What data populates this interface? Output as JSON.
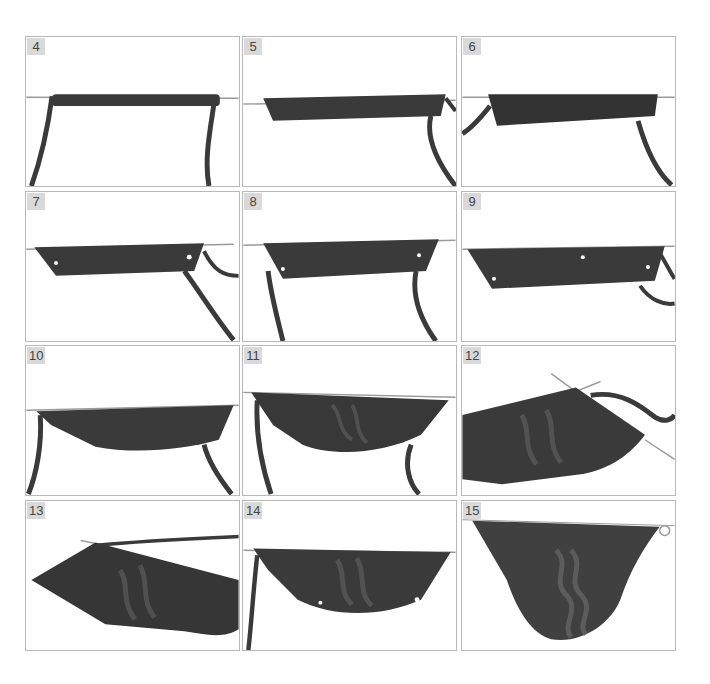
{
  "figure": {
    "type": "step-by-step photo grid",
    "rows": 4,
    "columns": 3,
    "colors": {
      "yarn": "#3a3a3a",
      "yarn_light": "#5a5a5a",
      "needle": "#9a9a9a",
      "panel_border": "#b8b8b8",
      "badge_bg": "#d9d9d9",
      "badge_text": "#444444"
    },
    "panels": [
      {
        "step": "4"
      },
      {
        "step": "5"
      },
      {
        "step": "6"
      },
      {
        "step": "7"
      },
      {
        "step": "8"
      },
      {
        "step": "9"
      },
      {
        "step": "10"
      },
      {
        "step": "11"
      },
      {
        "step": "12"
      },
      {
        "step": "13"
      },
      {
        "step": "14"
      },
      {
        "step": "15"
      }
    ]
  }
}
